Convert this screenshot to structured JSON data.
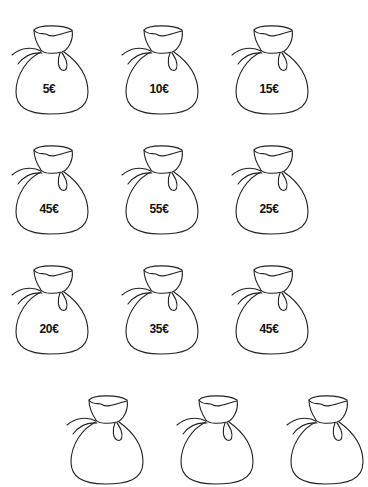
{
  "worksheet": {
    "stroke_color": "#222222",
    "background": "#ffffff",
    "bags": [
      {
        "label": "5€",
        "x": 4,
        "y": 22
      },
      {
        "label": "10€",
        "x": 114,
        "y": 22
      },
      {
        "label": "15€",
        "x": 224,
        "y": 22
      },
      {
        "label": "45€",
        "x": 4,
        "y": 142
      },
      {
        "label": "55€",
        "x": 114,
        "y": 142
      },
      {
        "label": "25€",
        "x": 224,
        "y": 142
      },
      {
        "label": "20€",
        "x": 4,
        "y": 262
      },
      {
        "label": "35€",
        "x": 114,
        "y": 262
      },
      {
        "label": "45€",
        "x": 224,
        "y": 262
      },
      {
        "label": "",
        "x": 59,
        "y": 392
      },
      {
        "label": "",
        "x": 169,
        "y": 392
      },
      {
        "label": "",
        "x": 279,
        "y": 392
      }
    ]
  }
}
